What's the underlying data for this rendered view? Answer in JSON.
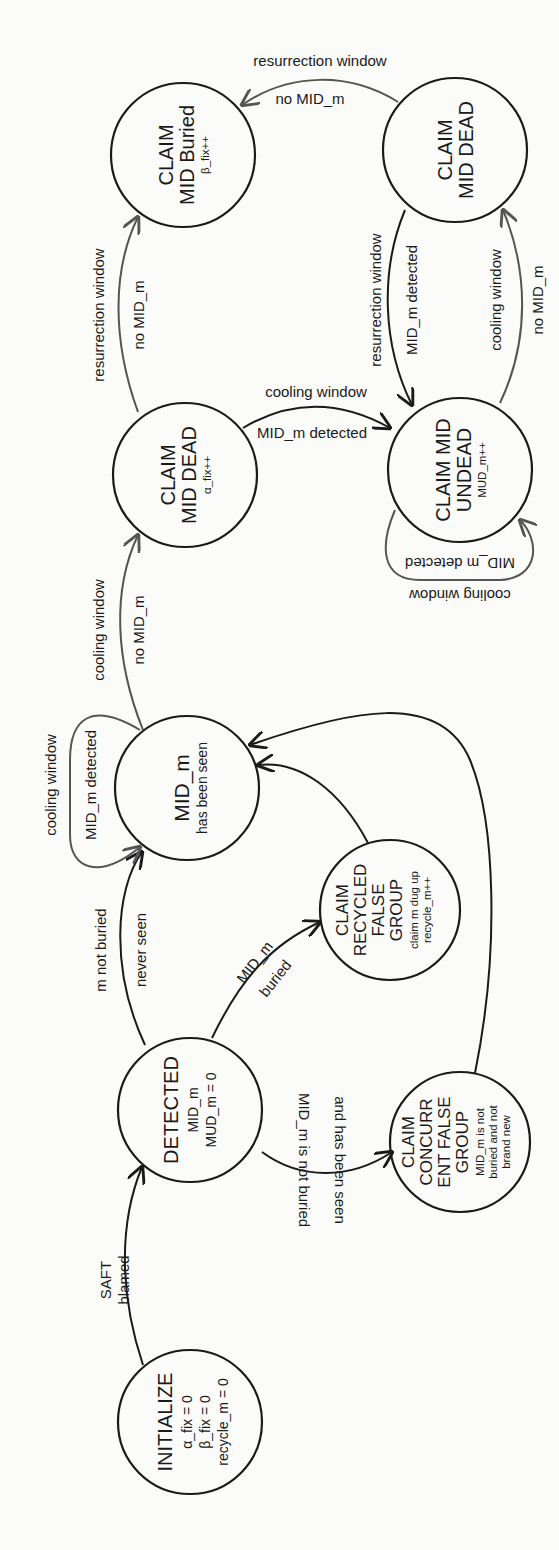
{
  "diagram": {
    "type": "state-machine",
    "orientation": "rotated-90-ccw",
    "nodes": {
      "initialize": {
        "title": "INITIALIZE",
        "lines": [
          "α_fix = 0",
          "β_fix = 0",
          "recycle_m = 0"
        ]
      },
      "detected": {
        "title": "DETECTED",
        "lines": [
          "MID_m",
          "MUD_m = 0"
        ]
      },
      "concurrent": {
        "title_lines": [
          "CLAIM",
          "CONCURR",
          "ENT FALSE",
          "GROUP"
        ],
        "lines": [
          "MID_m is not",
          "buried and not",
          "brand new"
        ]
      },
      "recycled": {
        "title_lines": [
          "CLAIM",
          "RECYCLED",
          "FALSE",
          "GROUP"
        ],
        "lines": [
          "claim m dug up",
          "recycle_m++"
        ]
      },
      "seen": {
        "title": "MID_m",
        "lines": [
          "has been seen"
        ]
      },
      "dead_alpha": {
        "title_lines": [
          "CLAIM",
          "MID DEAD"
        ],
        "lines": [
          "α_fix++"
        ]
      },
      "undead": {
        "title_lines": [
          "CLAIM MID",
          "UNDEAD"
        ],
        "lines": [
          "MUD_m++"
        ]
      },
      "buried": {
        "title_lines": [
          "CLAIM",
          "MID Buried"
        ],
        "lines": [
          "β_fix++"
        ]
      },
      "dead_top": {
        "title_lines": [
          "CLAIM",
          "MID DEAD"
        ],
        "lines": []
      }
    },
    "edges": {
      "init_detected": [
        "SAFT",
        "blamed"
      ],
      "detected_seen": [
        "m not buried",
        "never seen"
      ],
      "detected_recycled": [
        "MID_m",
        "buried"
      ],
      "detected_concurrent": [
        "MID_m is not buried",
        "and has been seen"
      ],
      "seen_self": [
        "cooling window",
        "MID_m detected"
      ],
      "seen_deadalpha": [
        "cooling window",
        "no MID_m"
      ],
      "deadalpha_undead": [
        "cooling window",
        "MID_m detected"
      ],
      "deadalpha_buried": [
        "resurrection window",
        "no MID_m"
      ],
      "undead_self": [
        "cooling window",
        "MID_m detected"
      ],
      "undead_deadtop": [
        "cooling window",
        "no MID_m"
      ],
      "deadtop_undead": [
        "resurrection window",
        "MID_m detected"
      ],
      "deadtop_buried": [
        "resurrection window",
        "no MID_m"
      ]
    },
    "colors": {
      "stroke": "#1a1a1a",
      "grey_stroke": "#555555",
      "background": "#fbfbf9"
    }
  }
}
